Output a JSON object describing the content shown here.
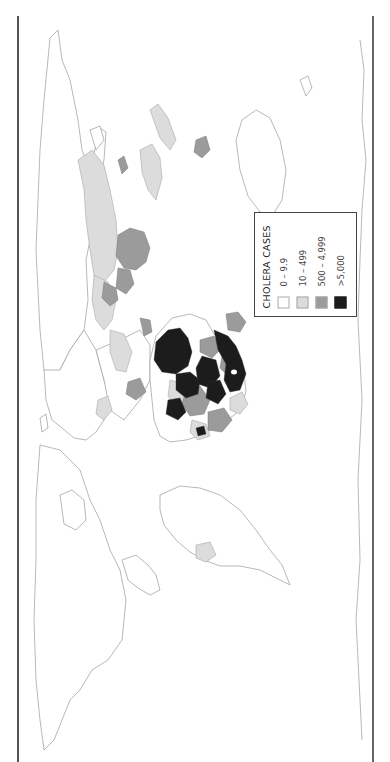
{
  "map": {
    "title": "Cholera cases world map",
    "orientation": "rotated 90° clockwise (north points left)",
    "colors": {
      "outline": "#9a9a9a",
      "land_none": "#ffffff",
      "low": "#dcdcdc",
      "medium": "#9b9b9b",
      "high": "#1c1c1c"
    },
    "regions": [
      {
        "name": "Africa",
        "category": "mixed (medium / high)"
      },
      {
        "name": "Madagascar",
        "category": "500 – 4,999"
      },
      {
        "name": "India",
        "category": "500 – 4,999"
      },
      {
        "name": "China",
        "category": "10 – 499"
      },
      {
        "name": "Southeast Asia",
        "category": "10 – 499 / 500 – 4,999"
      },
      {
        "name": "Papua New Guinea",
        "category": "500 – 4,999"
      },
      {
        "name": "Americas",
        "category": "0 – 9.9"
      },
      {
        "name": "Haiti / Dominican Republic region",
        "category": "10 – 499"
      }
    ]
  },
  "legend": {
    "title": "CHOLERA CASES",
    "items": [
      {
        "label": "0 – 9.9",
        "color": "#ffffff"
      },
      {
        "label": "10 – 499",
        "color": "#dcdcdc"
      },
      {
        "label": "500 – 4,999",
        "color": "#9b9b9b"
      },
      {
        "label": ">5,000",
        "color": "#1c1c1c"
      }
    ]
  }
}
